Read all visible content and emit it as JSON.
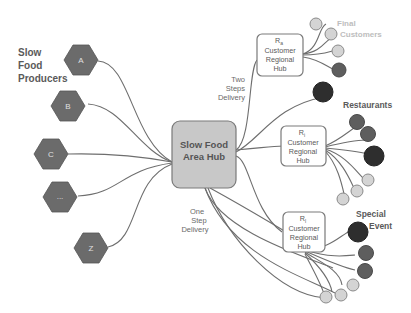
{
  "diagram": {
    "colors": {
      "producer_hex": "#6b6b6b",
      "area_hub_fill": "#c8c8c8",
      "regional_hub_fill": "#ffffff",
      "final_customer": "#d4d4d4",
      "restaurant": "#5e5e5e",
      "special_event": "#2e2e2e",
      "edge": "#6e6e6e"
    },
    "labels": {
      "producers_line1": "Slow",
      "producers_line2": "Food",
      "producers_line3": "Producers",
      "final_customers_line1": "Final",
      "final_customers_line2": "Customers",
      "restaurants": "Restaurants",
      "special_event_line1": "Special",
      "special_event_line2": "Event",
      "two_steps_line1": "Two",
      "two_steps_line2": "Steps",
      "two_steps_line3": "Delivery",
      "one_step_line1": "One",
      "one_step_line2": "Step",
      "one_step_line3": "Delivery"
    },
    "producers": [
      {
        "id": "A",
        "label": "A"
      },
      {
        "id": "B",
        "label": "B"
      },
      {
        "id": "C",
        "label": "C"
      },
      {
        "id": "ellipsis",
        "label": "..."
      },
      {
        "id": "Z",
        "label": "Z"
      }
    ],
    "area_hub": {
      "line1": "Slow Food",
      "line2": "Area Hub"
    },
    "regional_hubs": [
      {
        "id": "Ra",
        "r": "R",
        "sub": "a",
        "line1": "Customer",
        "line2": "Regional",
        "line3": "Hub"
      },
      {
        "id": "Ri",
        "r": "R",
        "sub": "i",
        "line1": "Customer",
        "line2": "Regional",
        "line3": "Hub"
      },
      {
        "id": "Rl",
        "r": "R",
        "sub": "l",
        "line1": "Customer",
        "line2": "Regional",
        "line3": "Hub"
      }
    ],
    "customer_nodes": {
      "Ra": [
        "final-customer",
        "final-customer",
        "final-customer",
        "restaurant"
      ],
      "Ri": [
        "restaurant",
        "restaurant",
        "special-event",
        "final-customer",
        "final-customer",
        "final-customer"
      ],
      "Rl": [
        "special-event",
        "restaurant",
        "restaurant",
        "final-customer",
        "final-customer",
        "final-customer"
      ],
      "direct_from_area_hub": [
        "special-event"
      ]
    }
  }
}
